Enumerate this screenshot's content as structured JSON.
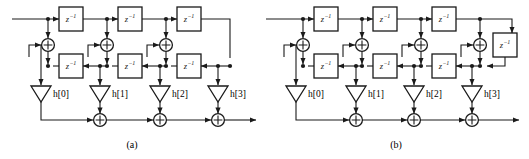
{
  "figure": {
    "type": "signal-flow-graph",
    "width": 529,
    "height": 159,
    "line_color": "#1a1a1a",
    "background": "#ffffff"
  },
  "delay_label": {
    "base": "z",
    "exponent": "−1",
    "full": "z⁻¹"
  },
  "panels": [
    {
      "id": "a",
      "caption": "(a)",
      "caption_x": 132,
      "caption_y": 146,
      "origin_x": 0,
      "top_row_y": 19,
      "adder_row_y": 45,
      "delay_row_y": 66,
      "gain_row_y": 92,
      "output_row_y": 120,
      "input_x": 12,
      "output_x": 258,
      "taps": [
        {
          "label": "h[0]",
          "symbol": "h",
          "index": "[0]",
          "x": 41
        },
        {
          "label": "h[1]",
          "symbol": "h",
          "index": "[1]",
          "x": 100
        },
        {
          "label": "h[2]",
          "symbol": "h",
          "index": "[2]",
          "x": 160
        },
        {
          "label": "h[3]",
          "symbol": "h",
          "index": "[3]",
          "x": 218
        }
      ],
      "top_delays": [
        {
          "cx": 71,
          "cy": 19
        },
        {
          "cx": 130,
          "cy": 19
        },
        {
          "cx": 189,
          "cy": 19
        }
      ],
      "bottom_delays": [
        {
          "cx": 71,
          "cy": 66
        },
        {
          "cx": 130,
          "cy": 66
        },
        {
          "cx": 189,
          "cy": 66
        }
      ],
      "upper_adders": [
        {
          "cx": 48,
          "cy": 45
        },
        {
          "cx": 107,
          "cy": 45
        },
        {
          "cx": 166,
          "cy": 45
        }
      ],
      "output_adders": [
        {
          "cx": 100,
          "cy": 120
        },
        {
          "cx": 160,
          "cy": 120
        },
        {
          "cx": 218,
          "cy": 120
        }
      ],
      "extra_delay": null
    },
    {
      "id": "b",
      "caption": "(b)",
      "caption_x": 396,
      "caption_y": 146,
      "origin_x": 264,
      "top_row_y": 19,
      "adder_row_y": 45,
      "delay_row_y": 66,
      "gain_row_y": 92,
      "output_row_y": 120,
      "input_x": 266,
      "output_x": 521,
      "taps": [
        {
          "label": "h[0]",
          "symbol": "h",
          "index": "[0]",
          "x": 296
        },
        {
          "label": "h[1]",
          "symbol": "h",
          "index": "[1]",
          "x": 356
        },
        {
          "label": "h[2]",
          "symbol": "h",
          "index": "[2]",
          "x": 414
        },
        {
          "label": "h[3]",
          "symbol": "h",
          "index": "[3]",
          "x": 472
        }
      ],
      "top_delays": [
        {
          "cx": 326,
          "cy": 19
        },
        {
          "cx": 385,
          "cy": 19
        },
        {
          "cx": 444,
          "cy": 19
        }
      ],
      "bottom_delays": [
        {
          "cx": 326,
          "cy": 66
        },
        {
          "cx": 385,
          "cy": 66
        },
        {
          "cx": 444,
          "cy": 66
        }
      ],
      "upper_adders": [
        {
          "cx": 303,
          "cy": 45
        },
        {
          "cx": 362,
          "cy": 45
        },
        {
          "cx": 421,
          "cy": 45
        },
        {
          "cx": 480,
          "cy": 45
        }
      ],
      "output_adders": [
        {
          "cx": 356,
          "cy": 120
        },
        {
          "cx": 414,
          "cy": 120
        },
        {
          "cx": 472,
          "cy": 120
        }
      ],
      "extra_delay": {
        "cx": 505,
        "cy": 45
      }
    }
  ]
}
